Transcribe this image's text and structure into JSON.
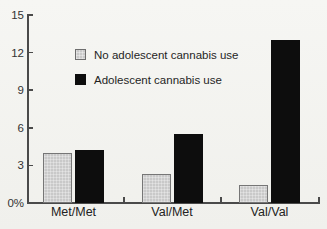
{
  "figure": {
    "background": "#f3f3f0",
    "kind": "scanned bar chart"
  },
  "chart_data": {
    "type": "bar",
    "title": "",
    "categories": [
      "Met/Met",
      "Val/Met",
      "Val/Val"
    ],
    "series": [
      {
        "name": "No adolescent cannabis use",
        "color": "#c9c9c9",
        "pattern": "halftone-grid",
        "values": [
          4.0,
          2.3,
          1.4
        ]
      },
      {
        "name": "Adolescent cannabis use",
        "color": "#0d0d0d",
        "pattern": "solid",
        "values": [
          4.2,
          5.5,
          13.0
        ]
      }
    ],
    "xlabel": "",
    "ylabel": "",
    "ylim": [
      0,
      15
    ],
    "y_ticks": [
      {
        "value": 15,
        "label": "15"
      },
      {
        "value": 12,
        "label": "12"
      },
      {
        "value": 9,
        "label": "9"
      },
      {
        "value": 6,
        "label": "6"
      },
      {
        "value": 3,
        "label": "3"
      },
      {
        "value": 0,
        "label": "0%"
      }
    ],
    "grid": false,
    "legend_position": "upper-left-inside",
    "axis_color": "#4a4a4a",
    "text_color": "#2b2b2b"
  }
}
